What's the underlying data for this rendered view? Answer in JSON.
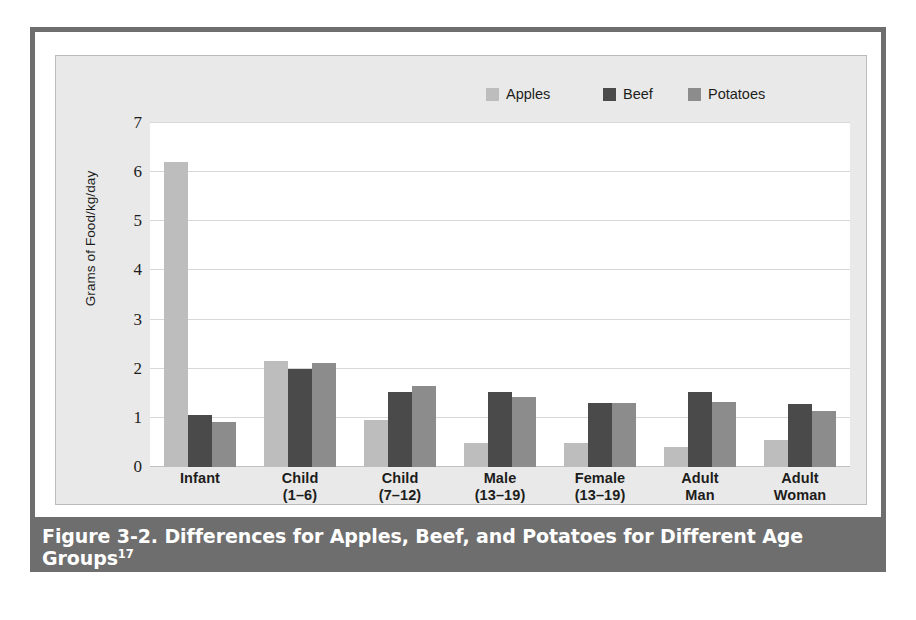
{
  "figure": {
    "caption_text": "Figure 3-2. Differences for Apples, Beef, and Potatoes for Different Age Groups",
    "caption_superscript": "17"
  },
  "colors": {
    "apples": "#bdbdbd",
    "beef": "#4a4a4a",
    "potatoes": "#8c8c8c",
    "frame": "#6e6e6e",
    "panel_bg": "#e9e9e9",
    "plot_bg": "#ffffff",
    "gridline": "#d8d8d8"
  },
  "legend": {
    "position": "top-right",
    "items": [
      {
        "label": "Apples",
        "swatch": "apples"
      },
      {
        "label": "Beef",
        "swatch": "beef"
      },
      {
        "label": "Potatoes",
        "swatch": "potatoes"
      }
    ]
  },
  "chart_data": {
    "type": "bar",
    "title": "",
    "xlabel": "",
    "ylabel": "Grams of Food/kg/day",
    "ylim": [
      0,
      7
    ],
    "yticks": [
      0,
      1,
      2,
      3,
      4,
      5,
      6,
      7
    ],
    "ytick_labels": [
      "0",
      "1",
      "2",
      "3",
      "4",
      "5",
      "6",
      "7"
    ],
    "grid": true,
    "legend_position": "top-right",
    "categories": [
      "Infant",
      "Child (1–6)",
      "Child (7–12)",
      "Male (13–19)",
      "Female (13–19)",
      "Adult Man",
      "Adult Woman"
    ],
    "category_lines": [
      {
        "line1": "Infant",
        "line2": ""
      },
      {
        "line1": "Child",
        "line2": "(1–6)"
      },
      {
        "line1": "Child",
        "line2": "(7–12)"
      },
      {
        "line1": "Male",
        "line2": "(13–19)"
      },
      {
        "line1": "Female",
        "line2": "(13–19)"
      },
      {
        "line1": "Adult",
        "line2": "Man"
      },
      {
        "line1": "Adult",
        "line2": "Woman"
      }
    ],
    "series": [
      {
        "name": "Apples",
        "key": "apples",
        "values": [
          6.2,
          2.15,
          0.95,
          0.48,
          0.48,
          0.4,
          0.55
        ]
      },
      {
        "name": "Beef",
        "key": "beef",
        "values": [
          1.05,
          2.0,
          1.53,
          1.52,
          1.3,
          1.53,
          1.28
        ]
      },
      {
        "name": "Potatoes",
        "key": "potatoes",
        "values": [
          0.92,
          2.12,
          1.65,
          1.43,
          1.3,
          1.32,
          1.15
        ]
      }
    ]
  }
}
